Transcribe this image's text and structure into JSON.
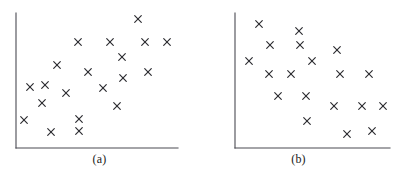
{
  "figure": {
    "background_color": "#ffffff",
    "axis_color": "#4a4a52",
    "marker_color": "#2b2b30",
    "marker_symbol": "x",
    "panel_count": 2
  },
  "panels": [
    {
      "id": "panel-a",
      "caption": "(a)",
      "caption_x": 98,
      "caption_y": 158,
      "axis": {
        "origin_x": 16,
        "origin_y": 148,
        "y_axis_top": 13,
        "x_axis_right": 178
      }
    },
    {
      "id": "panel-b",
      "caption": "(b)",
      "caption_x": 104,
      "caption_y": 158,
      "axis": {
        "origin_x": 36,
        "origin_y": 148,
        "y_axis_top": 13,
        "x_axis_right": 191
      }
    }
  ],
  "chart_data": [
    {
      "type": "scatter",
      "title": "(a)",
      "xlabel": "",
      "ylabel": "",
      "correlation": "positive",
      "marker": "x",
      "grid": false,
      "legend": false,
      "xlim": [
        16,
        178
      ],
      "ylim": [
        13,
        148
      ],
      "points": [
        {
          "x": 138,
          "y": 19
        },
        {
          "x": 78,
          "y": 42
        },
        {
          "x": 110,
          "y": 42
        },
        {
          "x": 145,
          "y": 42
        },
        {
          "x": 167,
          "y": 42
        },
        {
          "x": 122,
          "y": 57
        },
        {
          "x": 57,
          "y": 65
        },
        {
          "x": 88,
          "y": 72
        },
        {
          "x": 148,
          "y": 72
        },
        {
          "x": 123,
          "y": 78
        },
        {
          "x": 45,
          "y": 85
        },
        {
          "x": 30,
          "y": 87
        },
        {
          "x": 103,
          "y": 88
        },
        {
          "x": 66,
          "y": 93
        },
        {
          "x": 42,
          "y": 103
        },
        {
          "x": 24,
          "y": 120
        },
        {
          "x": 79,
          "y": 119
        },
        {
          "x": 51,
          "y": 132
        },
        {
          "x": 79,
          "y": 131
        },
        {
          "x": 117,
          "y": 106
        }
      ]
    },
    {
      "type": "scatter",
      "title": "(b)",
      "xlabel": "",
      "ylabel": "",
      "correlation": "negative",
      "marker": "x",
      "grid": false,
      "legend": false,
      "xlim": [
        36,
        191
      ],
      "ylim": [
        13,
        148
      ],
      "points": [
        {
          "x": 60,
          "y": 24
        },
        {
          "x": 100,
          "y": 31
        },
        {
          "x": 71,
          "y": 45
        },
        {
          "x": 101,
          "y": 45
        },
        {
          "x": 138,
          "y": 50
        },
        {
          "x": 50,
          "y": 61
        },
        {
          "x": 113,
          "y": 61
        },
        {
          "x": 70,
          "y": 74
        },
        {
          "x": 92,
          "y": 74
        },
        {
          "x": 141,
          "y": 74
        },
        {
          "x": 170,
          "y": 74
        },
        {
          "x": 79,
          "y": 96
        },
        {
          "x": 107,
          "y": 96
        },
        {
          "x": 135,
          "y": 106
        },
        {
          "x": 163,
          "y": 106
        },
        {
          "x": 184,
          "y": 106
        },
        {
          "x": 108,
          "y": 121
        },
        {
          "x": 148,
          "y": 134
        },
        {
          "x": 173,
          "y": 131
        }
      ]
    }
  ]
}
